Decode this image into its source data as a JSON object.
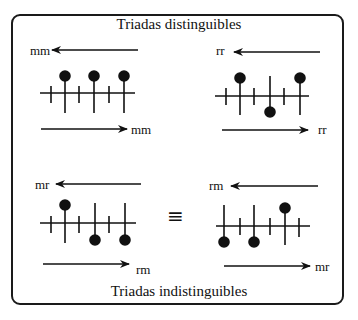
{
  "title_top": "Triadas distinguibles",
  "title_bottom": "Triadas indistinguibles",
  "equivalence_symbol": "≡",
  "colors": {
    "ink": "#111111",
    "background": "#ffffff"
  },
  "panels": [
    {
      "id": "top-left",
      "group": "distinguibles",
      "left_label": "mm",
      "right_label": "mm",
      "stems": [
        "up",
        "up",
        "up"
      ]
    },
    {
      "id": "top-right",
      "group": "distinguibles",
      "left_label": "rr",
      "right_label": "rr",
      "stems": [
        "up",
        "down",
        "up"
      ]
    },
    {
      "id": "bottom-left",
      "group": "indistinguibles",
      "left_label": "mr",
      "right_label": "rm",
      "stems": [
        "up",
        "down",
        "down"
      ]
    },
    {
      "id": "bottom-right",
      "group": "indistinguibles",
      "left_label": "rm",
      "right_label": "mr",
      "stems": [
        "down",
        "down",
        "up"
      ]
    }
  ]
}
